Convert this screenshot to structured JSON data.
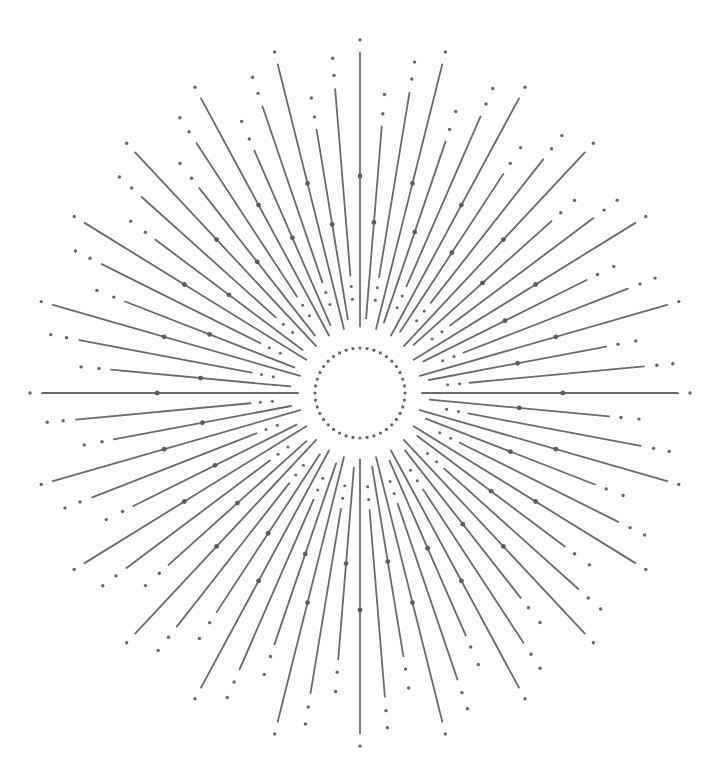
{
  "illustration": {
    "subject": "sunburst line art",
    "center": {
      "x": 360,
      "y": 393
    },
    "scale": {
      "x": 1.0,
      "y": 1.07
    },
    "colors": {
      "background": "#ffffff",
      "line": "#6a6a6a",
      "dot": "#666666",
      "bead": "#5c5c5c"
    },
    "ring": {
      "radius": 45,
      "dot_count": 40,
      "dot_radius": 1.6
    },
    "rays": {
      "count": 72,
      "start_angle_deg": -90,
      "stroke_width": 1.8,
      "pattern": [
        {
          "kind": "long",
          "inner": 62,
          "outer": 318,
          "bead_at": 0.55,
          "tip_dots": [
            330
          ]
        },
        {
          "kind": "medium",
          "inner": 70,
          "outer": 250,
          "bead_at": 0.5,
          "tip_dots": [
            262,
            280
          ]
        },
        {
          "kind": "short",
          "inner": 110,
          "outer": 285,
          "bead_at": null,
          "tip_dots": [
            298,
            314
          ],
          "inner_dots": [
            88,
            100
          ]
        }
      ]
    }
  }
}
